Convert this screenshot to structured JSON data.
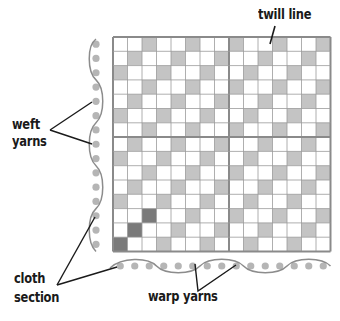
{
  "diagram": {
    "labels": {
      "twill_line": "twill line",
      "weft_line1": "weft",
      "weft_line2": "yarns",
      "cloth_line1": "cloth",
      "cloth_line2": "section",
      "warp": "warp yarns"
    },
    "grid": {
      "cols": 15,
      "rows": 15,
      "divider_after_col": 7,
      "divider_after_row": 6,
      "shade_rule": "(col + row) % 3 == 2",
      "dark_cells": [
        [
          14,
          0
        ],
        [
          13,
          1
        ],
        [
          12,
          2
        ]
      ]
    },
    "colors": {
      "cell_white": "#ffffff",
      "cell_shaded": "#c4c4c4",
      "cell_dark": "#7a7a7a",
      "grid_line": "#9a9a9a",
      "border": "#8a8a8a",
      "yarn_dot": "#b5b5b5",
      "yarn_thread": "#8c8c8c",
      "leader_line": "#1a1a1a",
      "text": "#1a1a1a"
    }
  }
}
